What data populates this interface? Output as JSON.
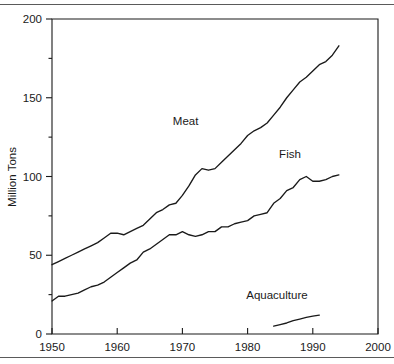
{
  "figure": {
    "has_top_rule": true,
    "has_bottom_rule": true,
    "rule_color": "#5a5a5a",
    "line_color": "#1a1a1a",
    "background": "#ffffff"
  },
  "chart_data": {
    "type": "line",
    "title": "",
    "xlabel": "",
    "ylabel": "Million Tons",
    "xlim": [
      1950,
      2000
    ],
    "ylim": [
      0,
      200
    ],
    "grid": false,
    "legend_position": "inline-annotations",
    "x_ticks": [
      1950,
      1960,
      1970,
      1980,
      1990,
      2000
    ],
    "x_tick_labels": [
      "1950",
      "1960",
      "1970",
      "1980",
      "1990",
      "2000"
    ],
    "x_minor_ticks": [
      1955,
      1965,
      1975,
      1985,
      1995
    ],
    "y_ticks": [
      0,
      50,
      100,
      150,
      200
    ],
    "y_tick_labels": [
      "0",
      "50",
      "100",
      "150",
      "200"
    ],
    "y_minor_ticks": [
      25,
      75,
      125,
      175
    ],
    "annotations": [
      {
        "text": "Meat",
        "x": 1970.5,
        "y": 133
      },
      {
        "text": "Fish",
        "x": 1986.5,
        "y": 112
      },
      {
        "text": "Aquaculture",
        "x": 1984.5,
        "y": 22
      }
    ],
    "series": [
      {
        "name": "Meat",
        "x": [
          1950,
          1951,
          1952,
          1953,
          1954,
          1955,
          1956,
          1957,
          1958,
          1959,
          1960,
          1961,
          1962,
          1963,
          1964,
          1965,
          1966,
          1967,
          1968,
          1969,
          1970,
          1971,
          1972,
          1973,
          1974,
          1975,
          1976,
          1977,
          1978,
          1979,
          1980,
          1981,
          1982,
          1983,
          1984,
          1985,
          1986,
          1987,
          1988,
          1989,
          1990,
          1991,
          1992,
          1993,
          1994
        ],
        "values": [
          44,
          46,
          48,
          50,
          52,
          54,
          56,
          58,
          61,
          64,
          64,
          63,
          65,
          67,
          69,
          73,
          77,
          79,
          82,
          83,
          88,
          94,
          101,
          105,
          104,
          105,
          109,
          113,
          117,
          121,
          126,
          129,
          131,
          134,
          139,
          144,
          150,
          155,
          160,
          163,
          167,
          171,
          173,
          177,
          183
        ]
      },
      {
        "name": "Fish",
        "x": [
          1950,
          1951,
          1952,
          1953,
          1954,
          1955,
          1956,
          1957,
          1958,
          1959,
          1960,
          1961,
          1962,
          1963,
          1964,
          1965,
          1966,
          1967,
          1968,
          1969,
          1970,
          1971,
          1972,
          1973,
          1974,
          1975,
          1976,
          1977,
          1978,
          1979,
          1980,
          1981,
          1982,
          1983,
          1984,
          1985,
          1986,
          1987,
          1988,
          1989,
          1990,
          1991,
          1992,
          1993,
          1994
        ],
        "values": [
          21,
          24,
          24,
          25,
          26,
          28,
          30,
          31,
          33,
          36,
          39,
          42,
          45,
          47,
          52,
          54,
          57,
          60,
          63,
          63,
          65,
          63,
          62,
          63,
          65,
          65,
          68,
          68,
          70,
          71,
          72,
          75,
          76,
          77,
          83,
          86,
          91,
          93,
          98,
          100,
          97,
          97,
          98,
          100,
          101
        ]
      },
      {
        "name": "Aquaculture",
        "x": [
          1984,
          1985,
          1986,
          1987,
          1988,
          1989,
          1990,
          1991
        ],
        "values": [
          5,
          6,
          7,
          8.5,
          9.5,
          10.5,
          11.3,
          12
        ]
      }
    ]
  }
}
